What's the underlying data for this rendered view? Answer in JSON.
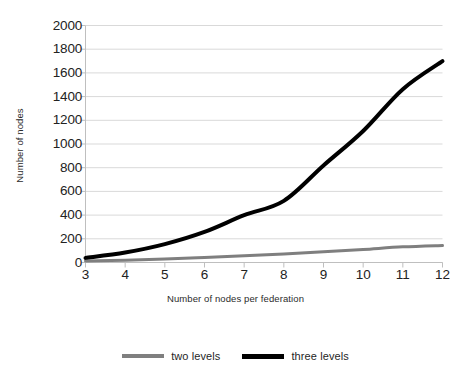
{
  "chart_data": {
    "type": "line",
    "title": "",
    "xlabel": "Number of nodes per federation",
    "ylabel": "Number of nodes",
    "x": [
      3,
      4,
      5,
      6,
      7,
      8,
      9,
      10,
      11,
      12
    ],
    "xlim": [
      3,
      12
    ],
    "ylim": [
      0,
      2000
    ],
    "ytick_labels": [
      "0",
      "200",
      "400",
      "600",
      "800",
      "1000",
      "1200",
      "1400",
      "1600",
      "1800",
      "2000"
    ],
    "ytick_values": [
      0,
      200,
      400,
      600,
      800,
      1000,
      1200,
      1400,
      1600,
      1800,
      2000
    ],
    "xtick_labels": [
      "3",
      "4",
      "5",
      "6",
      "7",
      "8",
      "9",
      "10",
      "11",
      "12"
    ],
    "grid": "horizontal",
    "legend_position": "bottom",
    "series": [
      {
        "name": "two levels",
        "color": "#7f7f7f",
        "width": 3,
        "values": [
          12,
          20,
          30,
          42,
          56,
          72,
          90,
          110,
          132,
          144
        ]
      },
      {
        "name": "three levels",
        "color": "#000000",
        "width": 4,
        "values": [
          39,
          84,
          155,
          258,
          399,
          520,
          819,
          1110,
          1463,
          1700
        ]
      }
    ]
  },
  "axes": {
    "x_title": "Number of nodes per federation",
    "y_title": "Number of nodes"
  },
  "legend": {
    "items": [
      {
        "label": "two levels",
        "color": "#7f7f7f"
      },
      {
        "label": "three levels",
        "color": "#000000"
      }
    ]
  },
  "style": {
    "grid_color": "#d9d9d9",
    "axis_color": "#bfbfbf",
    "text_color": "#222222",
    "background": "#ffffff"
  }
}
